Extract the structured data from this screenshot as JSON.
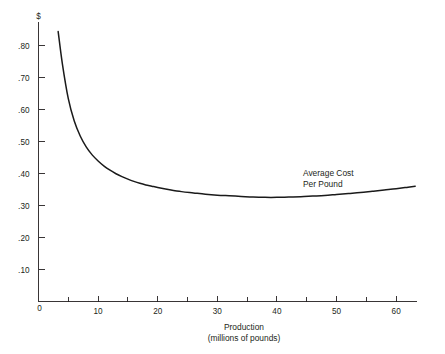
{
  "chart_data": {
    "type": "line",
    "title": "",
    "subtitle": "",
    "xlabel": "Production",
    "xlabel_sub": "(millions of pounds)",
    "ylabel": "",
    "yunit": "$",
    "xlim": [
      0,
      63.5
    ],
    "ylim": [
      0,
      0.875
    ],
    "grid": false,
    "legend_position": "inline-annotation",
    "annotations": [
      {
        "text_line1": "Average Cost",
        "text_line2": "Per Pound",
        "x": 46.3,
        "y": 0.4
      }
    ],
    "xticks": [
      0,
      10,
      20,
      30,
      40,
      50,
      60
    ],
    "xtick_labels": [
      "0",
      "10",
      "20",
      "30",
      "40",
      "50",
      "60"
    ],
    "xminor_ticks": [
      5,
      15,
      25,
      35,
      45,
      55
    ],
    "yticks": [
      0,
      0.1,
      0.2,
      0.3,
      0.4,
      0.5,
      0.6,
      0.7,
      0.8
    ],
    "ytick_labels": [
      "0",
      ".10",
      ".20",
      ".30",
      ".40",
      ".50",
      ".60",
      ".70",
      ".80"
    ],
    "series": [
      {
        "name": "Average Cost Per Pound",
        "color": "#1a1a1a",
        "x": [
          3.3,
          4,
          5,
          6,
          7,
          8,
          9,
          10,
          11,
          12,
          13,
          14,
          15,
          16,
          17,
          18,
          19,
          20,
          22,
          24,
          26,
          28,
          30,
          32,
          34,
          36,
          38,
          40,
          42,
          44,
          46,
          48,
          50,
          52,
          54,
          56,
          58,
          60,
          62,
          63.2
        ],
        "y": [
          0.845,
          0.745,
          0.635,
          0.565,
          0.518,
          0.484,
          0.459,
          0.44,
          0.424,
          0.411,
          0.4,
          0.391,
          0.383,
          0.376,
          0.37,
          0.365,
          0.361,
          0.357,
          0.35,
          0.344,
          0.34,
          0.336,
          0.333,
          0.331,
          0.329,
          0.327,
          0.326,
          0.326,
          0.327,
          0.328,
          0.33,
          0.332,
          0.335,
          0.338,
          0.341,
          0.345,
          0.349,
          0.353,
          0.358,
          0.361
        ]
      }
    ]
  }
}
